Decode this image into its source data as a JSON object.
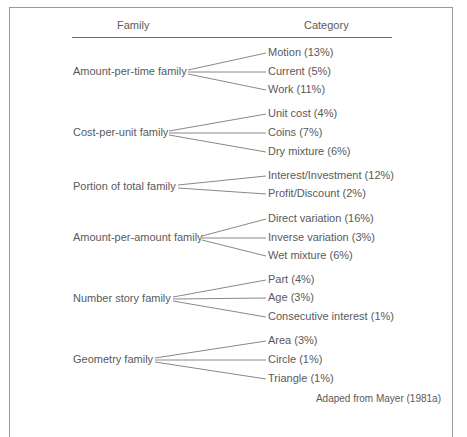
{
  "headers": {
    "family": "Family",
    "category": "Category"
  },
  "families": [
    {
      "name": "Amount-per-time family",
      "categories": [
        "Motion (13%)",
        "Current (5%)",
        "Work (11%)"
      ]
    },
    {
      "name": "Cost-per-unit family",
      "categories": [
        "Unit cost (4%)",
        "Coins (7%)",
        "Dry mixture (6%)"
      ]
    },
    {
      "name": "Portion of total family",
      "categories": [
        "Interest/Investment (12%)",
        "Profit/Discount (2%)"
      ]
    },
    {
      "name": "Amount-per-amount family",
      "categories": [
        "Direct variation (16%)",
        "Inverse variation (3%)",
        "Wet mixture (6%)"
      ]
    },
    {
      "name": "Number story family",
      "categories": [
        "Part (4%)",
        "Age (3%)",
        "Consecutive interest (1%)"
      ]
    },
    {
      "name": "Geometry family",
      "categories": [
        "Area (3%)",
        "Circle (1%)",
        "Triangle (1%)"
      ]
    }
  ],
  "caption": "Adaped from Mayer (1981a)"
}
